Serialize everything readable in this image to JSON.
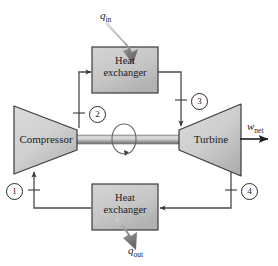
{
  "diagram": {
    "components": {
      "compressor": {
        "label": "Compressor"
      },
      "turbine": {
        "label": "Turbine"
      },
      "heat_exchanger_top": {
        "line1": "Heat",
        "line2": "exchanger"
      },
      "heat_exchanger_bottom": {
        "line1": "Heat",
        "line2": "exchanger"
      }
    },
    "flows": {
      "q_in": {
        "symbol": "q",
        "subscript": "in"
      },
      "q_out": {
        "symbol": "q",
        "subscript": "out"
      },
      "w_net": {
        "symbol": "w",
        "subscript": "net"
      }
    },
    "states": [
      {
        "id": "1",
        "label": "1"
      },
      {
        "id": "2",
        "label": "2"
      },
      {
        "id": "3",
        "label": "3"
      },
      {
        "id": "4",
        "label": "4"
      }
    ],
    "colors": {
      "body_fill_light": "#d6d6d6",
      "body_fill_dark": "#a8a8a8",
      "outline": "#3a3a3a",
      "line": "#4a4a4a",
      "arrow_gray": "#8c8c8c",
      "text": "#1a1a1a"
    }
  }
}
